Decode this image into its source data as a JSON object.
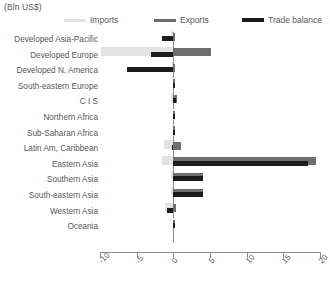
{
  "unit_label": "(Bln US$)",
  "legend": {
    "items": [
      {
        "label": "Imports",
        "color": "#e3e3e3",
        "thickness": 3,
        "x": 0,
        "swatch_x": 0,
        "text_x": 26
      },
      {
        "label": "Exports",
        "color": "#6e6e6e",
        "thickness": 3,
        "x": 90,
        "swatch_x": 90,
        "text_x": 116
      },
      {
        "label": "Trade balance",
        "color": "#1c1c1c",
        "thickness": 4,
        "x": 178,
        "swatch_x": 178,
        "text_x": 204
      }
    ]
  },
  "chart_data": {
    "type": "bar",
    "orientation": "horizontal",
    "title": "",
    "subtitle": "",
    "xlabel": "(Bln US$)",
    "ylabel": "",
    "xlim": [
      -10,
      20
    ],
    "xticks": [
      -10,
      -5,
      0,
      5,
      10,
      15,
      20
    ],
    "xtick_labels": [
      "-10",
      "-5",
      "0",
      "5",
      "10",
      "15",
      "20"
    ],
    "grid": false,
    "legend_position": "top",
    "zero_line": true,
    "categories": [
      "Developed Asia-Pacific",
      "Developed Europe",
      "Developed N. America",
      "South-eastern Europe",
      "C I S",
      "Northern Africa",
      "Sub-Saharan Africa",
      "Latin Am, Caribbean",
      "Eastern Asia",
      "Southern Asia",
      "South-eastern Asia",
      "Western Asia",
      "Oceania"
    ],
    "series": [
      {
        "name": "Imports",
        "color": "#e3e3e3",
        "values": [
          -0.3,
          -9.9,
          -0.2,
          -0.1,
          -0.3,
          -0.1,
          -0.1,
          -1.3,
          -1.6,
          -0.3,
          -0.3,
          -1.2,
          -0.1
        ]
      },
      {
        "name": "Exports",
        "color": "#6e6e6e",
        "values": [
          0.2,
          5.2,
          0.2,
          0.1,
          0.5,
          0.1,
          0.2,
          1.1,
          19.5,
          4.0,
          4.0,
          0.4,
          0.2
        ]
      },
      {
        "name": "Trade balance",
        "color": "#1c1c1c",
        "values": [
          -1.6,
          -3.1,
          -6.3,
          0.1,
          0.3,
          0.05,
          0.1,
          -0.2,
          18.3,
          4.0,
          4.0,
          -0.8,
          0.2
        ]
      }
    ]
  },
  "notes": {
    "category_count": 13
  }
}
